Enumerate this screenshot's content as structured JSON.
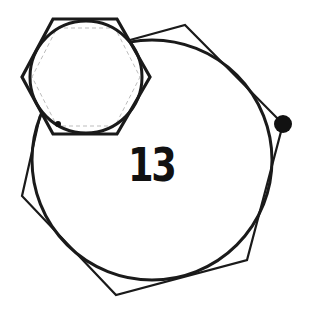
{
  "diagram": {
    "label": "13",
    "stroke_color": "#1a1a1a",
    "dashed_color": "#bdbdbd",
    "large_circle": {
      "cx": 152,
      "cy": 160,
      "r": 120
    },
    "large_polygon_points": "130,40 185,25 283,124 247,260 116,295 22,196 40,116",
    "small_hexagon_points": "53,19 117,19 150,77 117,134 53,134 22,77",
    "small_circle": {
      "cx": 86,
      "cy": 77,
      "r": 56
    },
    "dashed_hexagon_points": "57,28 115,28 140,77 115,126 57,126 32,77",
    "large_dot": {
      "cx": 283,
      "cy": 124,
      "r": 9
    },
    "small_dot": {
      "cx": 58,
      "cy": 124,
      "r": 3
    }
  }
}
